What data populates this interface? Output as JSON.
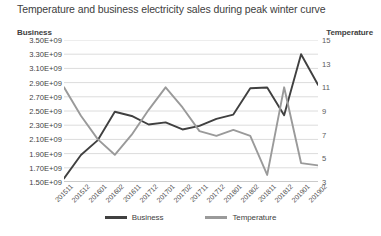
{
  "chart_data": {
    "type": "line",
    "title": "Temperature and business electricity sales during peak winter curve",
    "xlabel": "",
    "ylabel": "Business",
    "y2label": "Temperature",
    "grid": true,
    "legend_position": "bottom",
    "categories": [
      "201511",
      "201512",
      "201601",
      "201602",
      "201611",
      "201712",
      "201701",
      "201702",
      "201711",
      "201712",
      "201801",
      "201802",
      "201811",
      "201812",
      "201901",
      "201902"
    ],
    "ylim": [
      1500000000,
      3500000000
    ],
    "yticks": [
      "1.50E+09",
      "1.70E+09",
      "1.90E+09",
      "2.10E+09",
      "2.30E+09",
      "2.50E+09",
      "2.70E+09",
      "2.90E+09",
      "3.10E+09",
      "3.30E+09",
      "3.50E+09"
    ],
    "ytick_values": [
      1500000000,
      1700000000,
      1900000000,
      2100000000,
      2300000000,
      2500000000,
      2700000000,
      2900000000,
      3100000000,
      3300000000,
      3500000000
    ],
    "y2lim": [
      3,
      15
    ],
    "y2ticks": [
      "3",
      "5",
      "7",
      "9",
      "11",
      "13",
      "15"
    ],
    "y2tick_values": [
      3,
      5,
      7,
      9,
      11,
      13,
      15
    ],
    "series": [
      {
        "name": "Business",
        "axis": "left",
        "color": "#404040",
        "values": [
          1550000000,
          1880000000,
          2090000000,
          2490000000,
          2430000000,
          2310000000,
          2340000000,
          2240000000,
          2290000000,
          2390000000,
          2450000000,
          2820000000,
          2830000000,
          2440000000,
          3300000000,
          2870000000
        ]
      },
      {
        "name": "Temperature",
        "axis": "right",
        "color": "#9a9a9a",
        "values": [
          11.0,
          8.6,
          6.6,
          5.3,
          7.0,
          9.1,
          11.0,
          9.3,
          7.3,
          6.9,
          7.4,
          6.9,
          3.6,
          11.0,
          4.6,
          4.4
        ]
      }
    ]
  },
  "legend": {
    "items": [
      {
        "label": "Business",
        "color": "#404040"
      },
      {
        "label": "Temperature",
        "color": "#9a9a9a"
      }
    ]
  }
}
